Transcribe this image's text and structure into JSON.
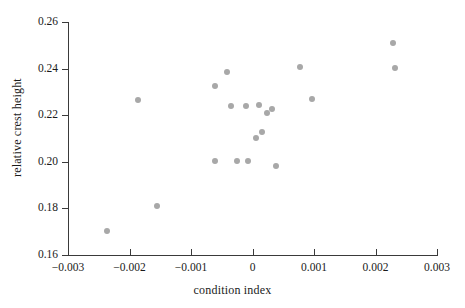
{
  "chart_data": {
    "type": "scatter",
    "title": "",
    "xlabel": "condition index",
    "ylabel": "relative crest height",
    "xlim": [
      -0.003,
      0.003
    ],
    "ylim": [
      0.16,
      0.26
    ],
    "xticks": [
      -0.003,
      -0.002,
      -0.001,
      0,
      0.001,
      0.002,
      0.003
    ],
    "xticklabels": [
      "−0.003",
      "−0.002",
      "−0.001",
      "0",
      "0.001",
      "0.002",
      "0.003"
    ],
    "yticks": [
      0.16,
      0.18,
      0.2,
      0.22,
      0.24,
      0.26
    ],
    "yticklabels": [
      "0.16",
      "0.18",
      "0.20",
      "0.22",
      "0.24",
      "0.26"
    ],
    "grid": false,
    "legend": null,
    "marker": {
      "shape": "circle",
      "color": "#a8a8a8",
      "size": 6
    },
    "points": [
      {
        "x": -0.00237,
        "y": 0.1705
      },
      {
        "x": -0.00156,
        "y": 0.1812
      },
      {
        "x": -0.00186,
        "y": 0.2267
      },
      {
        "x": -0.00061,
        "y": 0.2325
      },
      {
        "x": -0.00041,
        "y": 0.2385
      },
      {
        "x": -0.00035,
        "y": 0.2239
      },
      {
        "x": -0.0001,
        "y": 0.2239
      },
      {
        "x": 0.00011,
        "y": 0.2245
      },
      {
        "x": 0.00023,
        "y": 0.2208
      },
      {
        "x": 0.00031,
        "y": 0.2227
      },
      {
        "x": 0.00016,
        "y": 0.2126
      },
      {
        "x": 5e-05,
        "y": 0.2101
      },
      {
        "x": -0.00061,
        "y": 0.2004
      },
      {
        "x": -0.00026,
        "y": 0.2004
      },
      {
        "x": -8e-05,
        "y": 0.2004
      },
      {
        "x": 0.00039,
        "y": 0.1983
      },
      {
        "x": 0.00077,
        "y": 0.2408
      },
      {
        "x": 0.00096,
        "y": 0.2268
      },
      {
        "x": 0.00228,
        "y": 0.2508
      },
      {
        "x": 0.00231,
        "y": 0.2401
      }
    ]
  }
}
